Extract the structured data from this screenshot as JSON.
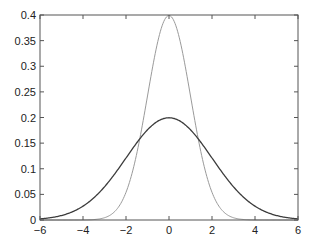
{
  "chart_data": {
    "type": "line",
    "title": "",
    "xlabel": "",
    "ylabel": "",
    "xlim": [
      -6,
      6
    ],
    "ylim": [
      0,
      0.4
    ],
    "grid": false,
    "legend": null,
    "x_ticks": [
      -6,
      -4,
      -2,
      0,
      2,
      4,
      6
    ],
    "x_tick_labels": [
      "−6",
      "−4",
      "−2",
      "0",
      "2",
      "4",
      "6"
    ],
    "y_ticks": [
      0,
      0.05,
      0.1,
      0.15,
      0.2,
      0.25,
      0.3,
      0.35,
      0.4
    ],
    "y_tick_labels": [
      "0",
      "0.05",
      "0.1",
      "0.15",
      "0.2",
      "0.25",
      "0.3",
      "0.35",
      "0.4"
    ],
    "series": [
      {
        "name": "Normal pdf, mean 0, sd 1",
        "color": "#9a9a9a",
        "width": 1,
        "mean": 0,
        "sd": 1,
        "x": [
          -6,
          -5,
          -4,
          -3,
          -2.5,
          -2,
          -1.5,
          -1,
          -0.5,
          0,
          0.5,
          1,
          1.5,
          2,
          2.5,
          3,
          4,
          5,
          6
        ],
        "values": [
          0.0,
          0.0,
          0.0001,
          0.0044,
          0.0175,
          0.054,
          0.1295,
          0.242,
          0.3521,
          0.3989,
          0.3521,
          0.242,
          0.1295,
          0.054,
          0.0175,
          0.0044,
          0.0001,
          0.0,
          0.0
        ]
      },
      {
        "name": "Normal pdf, mean 0, sd 2",
        "color": "#3c3c3c",
        "width": 1.3,
        "mean": 0,
        "sd": 2,
        "x": [
          -6,
          -5,
          -4,
          -3,
          -2,
          -1,
          0,
          1,
          2,
          3,
          4,
          5,
          6
        ],
        "values": [
          0.0022,
          0.0088,
          0.027,
          0.0648,
          0.121,
          0.176,
          0.1995,
          0.176,
          0.121,
          0.0648,
          0.027,
          0.0088,
          0.0022
        ]
      }
    ]
  },
  "layout": {
    "plot_left": 40,
    "plot_top": 15,
    "plot_right": 298,
    "plot_bottom": 220,
    "axis_color": "#555555"
  }
}
